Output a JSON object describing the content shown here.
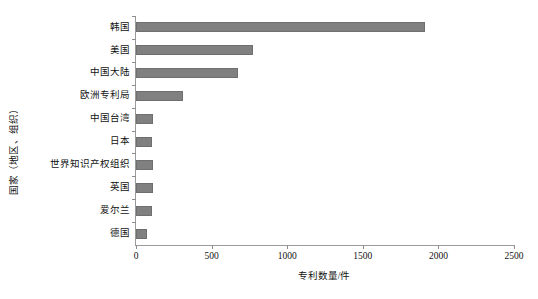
{
  "chart_data": {
    "type": "bar",
    "orientation": "horizontal",
    "title": "",
    "xlabel": "专利数量/件",
    "ylabel": "国家（地区、组织）",
    "categories": [
      "韩国",
      "美国",
      "中国大陆",
      "欧洲专利局",
      "中国台湾",
      "日本",
      "世界知识产权组织",
      "英国",
      "爱尔兰",
      "德国"
    ],
    "values": [
      1911,
      774,
      675,
      310,
      110,
      108,
      110,
      110,
      108,
      73
    ],
    "xlim": [
      0,
      2500
    ],
    "xticks": [
      0,
      500,
      1000,
      1500,
      2000,
      2500
    ],
    "xtick_labels": [
      "0",
      "500",
      "1000",
      "1500",
      "2000",
      "2500"
    ],
    "grid": false,
    "legend": null,
    "bar_color": "#808080",
    "axis_color": "#9a9a9a",
    "background_color": "#ffffff"
  }
}
